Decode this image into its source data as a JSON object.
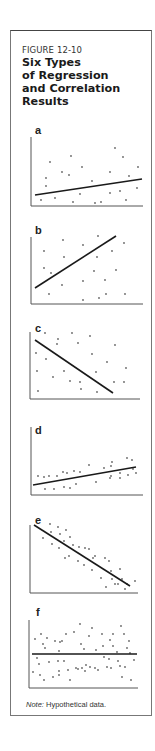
{
  "figure": {
    "number": "FIGURE 12-10",
    "title_lines": [
      "Six Types",
      "of Regression",
      "and Correlation",
      "Results"
    ],
    "note_label": "Note:",
    "note_text": " Hypothetical data."
  },
  "colors": {
    "axis": "#555555",
    "line": "#1a1a1a",
    "point": "#666666",
    "border": "#777777"
  },
  "chart_data": [
    {
      "type": "scatter",
      "label": "a",
      "title": "",
      "xlabel": "",
      "ylabel": "",
      "description": "Weak positive relationship, large scatter",
      "panel_top": 120,
      "axis": {
        "x0": 31,
        "y0": 206,
        "x1": 143,
        "ytop": 137
      },
      "regression_line": [
        [
          35,
          195
        ],
        [
          142,
          179
        ]
      ],
      "points": [
        [
          41,
          200
        ],
        [
          46,
          186
        ],
        [
          46,
          178
        ],
        [
          50,
          162
        ],
        [
          55,
          198
        ],
        [
          62,
          172
        ],
        [
          69,
          175
        ],
        [
          71,
          156
        ],
        [
          73,
          202
        ],
        [
          80,
          194
        ],
        [
          82,
          167
        ],
        [
          92,
          181
        ],
        [
          95,
          203
        ],
        [
          101,
          202
        ],
        [
          110,
          172
        ],
        [
          110,
          193
        ],
        [
          115,
          148
        ],
        [
          120,
          191
        ],
        [
          123,
          157
        ],
        [
          126,
          200
        ],
        [
          129,
          176
        ],
        [
          137,
          188
        ],
        [
          138,
          167
        ]
      ]
    },
    {
      "type": "scatter",
      "label": "b",
      "title": "",
      "xlabel": "",
      "ylabel": "",
      "description": "Moderate positive relationship",
      "panel_top": 222,
      "axis": {
        "x0": 31,
        "y0": 304,
        "x1": 143,
        "ytop": 237
      },
      "regression_line": [
        [
          35,
          288
        ],
        [
          116,
          236
        ]
      ],
      "points": [
        [
          44,
          251
        ],
        [
          44,
          268
        ],
        [
          49,
          294
        ],
        [
          51,
          273
        ],
        [
          62,
          285
        ],
        [
          63,
          240
        ],
        [
          64,
          257
        ],
        [
          83,
          245
        ],
        [
          83,
          281
        ],
        [
          83,
          300
        ],
        [
          97,
          257
        ],
        [
          98,
          236
        ],
        [
          94,
          271
        ],
        [
          99,
          298
        ],
        [
          105,
          280
        ],
        [
          106,
          294
        ],
        [
          112,
          251
        ],
        [
          116,
          270
        ],
        [
          124,
          243
        ],
        [
          125,
          294
        ]
      ]
    },
    {
      "type": "scatter",
      "label": "c",
      "title": "",
      "xlabel": "",
      "ylabel": "",
      "description": "Moderate negative relationship",
      "panel_top": 322,
      "axis": {
        "x0": 30,
        "y0": 399,
        "x1": 140,
        "ytop": 332
      },
      "regression_line": [
        [
          35,
          340
        ],
        [
          113,
          393
        ]
      ],
      "points": [
        [
          36,
          353
        ],
        [
          37,
          371
        ],
        [
          38,
          391
        ],
        [
          45,
          333
        ],
        [
          46,
          359
        ],
        [
          53,
          377
        ],
        [
          57,
          344
        ],
        [
          58,
          339
        ],
        [
          64,
          371
        ],
        [
          70,
          381
        ],
        [
          72,
          333
        ],
        [
          78,
          343
        ],
        [
          80,
          382
        ],
        [
          81,
          389
        ],
        [
          90,
          336
        ],
        [
          92,
          354
        ],
        [
          96,
          372
        ],
        [
          97,
          392
        ],
        [
          107,
          362
        ],
        [
          115,
          345
        ],
        [
          114,
          382
        ],
        [
          124,
          382
        ],
        [
          126,
          368
        ]
      ]
    },
    {
      "type": "scatter",
      "label": "d",
      "title": "",
      "xlabel": "",
      "ylabel": "",
      "description": "Weak-to-moderate positive relationship, tight scatter",
      "panel_top": 425,
      "axis": {
        "x0": 31,
        "y0": 495,
        "x1": 143,
        "ytop": 427
      },
      "regression_line": [
        [
          33,
          485
        ],
        [
          136,
          467
        ]
      ],
      "points": [
        [
          38,
          476
        ],
        [
          44,
          477
        ],
        [
          45,
          489
        ],
        [
          49,
          476
        ],
        [
          54,
          489
        ],
        [
          57,
          476
        ],
        [
          63,
          472
        ],
        [
          64,
          487
        ],
        [
          67,
          473
        ],
        [
          70,
          488
        ],
        [
          74,
          471
        ],
        [
          76,
          484
        ],
        [
          80,
          472
        ],
        [
          89,
          465
        ],
        [
          96,
          482
        ],
        [
          104,
          468
        ],
        [
          110,
          478
        ],
        [
          111,
          466
        ],
        [
          111,
          476
        ],
        [
          112,
          462
        ],
        [
          120,
          473
        ],
        [
          120,
          478
        ],
        [
          127,
          458
        ],
        [
          128,
          475
        ],
        [
          132,
          460
        ],
        [
          133,
          469
        ],
        [
          136,
          473
        ]
      ]
    },
    {
      "type": "scatter",
      "label": "e",
      "title": "",
      "xlabel": "",
      "ylabel": "",
      "description": "Strong negative relationship, tight scatter",
      "panel_top": 515,
      "axis": {
        "x0": 30,
        "y0": 593,
        "x1": 138,
        "ytop": 525
      },
      "regression_line": [
        [
          34,
          525
        ],
        [
          130,
          586
        ]
      ],
      "points": [
        [
          43,
          538
        ],
        [
          50,
          524
        ],
        [
          51,
          532
        ],
        [
          52,
          544
        ],
        [
          58,
          527
        ],
        [
          59,
          548
        ],
        [
          60,
          534
        ],
        [
          64,
          541
        ],
        [
          65,
          558
        ],
        [
          66,
          530
        ],
        [
          69,
          556
        ],
        [
          70,
          537
        ],
        [
          73,
          545
        ],
        [
          78,
          561
        ],
        [
          79,
          547
        ],
        [
          84,
          565
        ],
        [
          85,
          548
        ],
        [
          89,
          549
        ],
        [
          92,
          570
        ],
        [
          93,
          558
        ],
        [
          95,
          556
        ],
        [
          101,
          578
        ],
        [
          105,
          558
        ],
        [
          106,
          587
        ],
        [
          109,
          561
        ],
        [
          111,
          571
        ],
        [
          112,
          579
        ],
        [
          115,
          584
        ],
        [
          118,
          584
        ],
        [
          120,
          569
        ],
        [
          122,
          579
        ],
        [
          125,
          589
        ],
        [
          127,
          584
        ],
        [
          135,
          581
        ]
      ]
    },
    {
      "type": "scatter",
      "label": "f",
      "title": "",
      "xlabel": "",
      "ylabel": "",
      "description": "No relationship (horizontal line)",
      "panel_top": 605,
      "axis": {
        "x0": 29,
        "y0": 688,
        "x1": 138,
        "ytop": 620
      },
      "regression_line": [
        [
          32,
          654
        ],
        [
          137,
          654
        ]
      ],
      "points": [
        [
          33,
          672
        ],
        [
          35,
          639
        ],
        [
          37,
          658
        ],
        [
          39,
          664
        ],
        [
          40,
          675
        ],
        [
          41,
          634
        ],
        [
          43,
          644
        ],
        [
          44,
          680
        ],
        [
          45,
          648
        ],
        [
          47,
          638
        ],
        [
          49,
          662
        ],
        [
          53,
          677
        ],
        [
          55,
          641
        ],
        [
          58,
          661
        ],
        [
          59,
          651
        ],
        [
          59,
          671
        ],
        [
          59,
          675
        ],
        [
          60,
          642
        ],
        [
          62,
          641
        ],
        [
          64,
          661
        ],
        [
          66,
          634
        ],
        [
          68,
          670
        ],
        [
          70,
          680
        ],
        [
          74,
          632
        ],
        [
          76,
          668
        ],
        [
          78,
          669
        ],
        [
          80,
          624
        ],
        [
          81,
          644
        ],
        [
          82,
          668
        ],
        [
          84,
          649
        ],
        [
          85,
          671
        ],
        [
          86,
          665
        ],
        [
          89,
          636
        ],
        [
          90,
          667
        ],
        [
          92,
          628
        ],
        [
          95,
          668
        ],
        [
          96,
          650
        ],
        [
          98,
          670
        ],
        [
          102,
          634
        ],
        [
          103,
          646
        ],
        [
          104,
          657
        ],
        [
          107,
          667
        ],
        [
          109,
          659
        ],
        [
          110,
          640
        ],
        [
          111,
          668
        ],
        [
          113,
          634
        ],
        [
          113,
          646
        ],
        [
          117,
          652
        ],
        [
          118,
          661
        ],
        [
          120,
          666
        ],
        [
          121,
          626
        ],
        [
          122,
          677
        ],
        [
          124,
          634
        ],
        [
          125,
          667
        ],
        [
          127,
          648
        ],
        [
          129,
          641
        ],
        [
          130,
          653
        ],
        [
          131,
          680
        ],
        [
          134,
          660
        ]
      ]
    }
  ]
}
